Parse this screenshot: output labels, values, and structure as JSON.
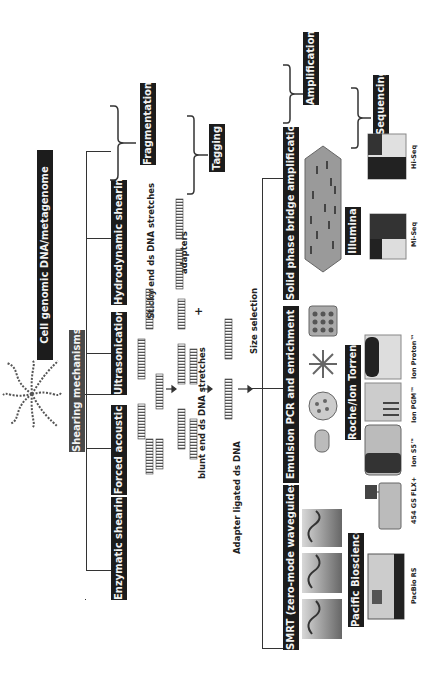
{
  "source": {
    "title": "Cell genomic DNA/metagenome",
    "process": "Shearing mechanisms"
  },
  "stages": {
    "fragmentation": "Fragmentation",
    "tagging": "Tagging",
    "amplification": "Amplification",
    "sequencing": "Sequencing"
  },
  "shearing_methods": [
    {
      "label": "Hydrodynamic shearing"
    },
    {
      "label": "Ultrasonication"
    },
    {
      "label": "Forced acoustic"
    },
    {
      "label": "Enzymatic shearing"
    }
  ],
  "tagging_labels": {
    "sticky": "Sticky end ds DNA stretches",
    "blunt": "blunt end ds DNA stretches",
    "adapters": "adapters",
    "plus": "+",
    "adapter_ligated": "Adapter ligated ds DNA",
    "size_selection": "Size selection"
  },
  "amplification_methods": [
    {
      "label": "Solid phase bridge amplification",
      "platform": "Illumina"
    },
    {
      "label": "Emulsion PCR and enrichment",
      "platform": "Roche/Ion Torrent"
    },
    {
      "label": "SMRT (zero-mode waveguides)",
      "platform": "Pacific Bioscience"
    }
  ],
  "instruments": [
    {
      "label": "Hi-Seq"
    },
    {
      "label": "Mi-Seq"
    },
    {
      "label": "Ion Proton™"
    },
    {
      "label": "Ion PGM™"
    },
    {
      "label": "Ion S5™"
    },
    {
      "label": "454 GS FLX+"
    },
    {
      "label": "PacBio RS"
    }
  ],
  "colors": {
    "box": "#1c1c1c",
    "box_grey": "#4a4a4a",
    "line": "#333333"
  }
}
